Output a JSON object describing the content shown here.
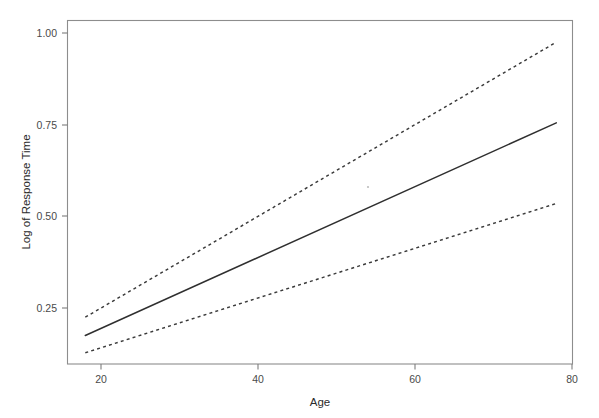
{
  "chart_data": {
    "type": "line",
    "title": "",
    "subtitle": "",
    "xlabel": "Age",
    "ylabel": "Log of Response Time",
    "xlim": [
      15.8,
      80.3
    ],
    "ylim": [
      0.105,
      1.02
    ],
    "xticks": [
      20,
      40,
      60,
      80
    ],
    "xticklabels": [
      "20",
      "40",
      "60",
      "80"
    ],
    "yticks": [
      0.25,
      0.5,
      0.75,
      1.0
    ],
    "yticklabels": [
      "0.25",
      "0.50",
      "0.75",
      "1.00"
    ],
    "grid": false,
    "legend": "none",
    "x": [
      18,
      78
    ],
    "series": [
      {
        "name": "Fitted regression line",
        "style": "solid",
        "color": "#2f2f2f",
        "values": [
          0.175,
          0.755
        ]
      },
      {
        "name": "Upper confidence band",
        "style": "dashed",
        "color": "#3a3a3a",
        "values": [
          0.225,
          0.975
        ]
      },
      {
        "name": "Lower confidence band",
        "style": "dashed",
        "color": "#3a3a3a",
        "values": [
          0.128,
          0.535
        ]
      }
    ],
    "annotations": []
  },
  "figure": {
    "background": "#ffffff",
    "frame_color": "#8d8d8d",
    "tick_color": "#7d7d7d",
    "label_color": "#2b2b2b",
    "tick_label_color": "#4a4a4a"
  },
  "axes": {
    "x_title": "Age",
    "y_title": "Log of Response Time",
    "x_tick_0": "20",
    "x_tick_1": "40",
    "x_tick_2": "60",
    "x_tick_3": "80",
    "y_tick_0": "0.25",
    "y_tick_1": "0.50",
    "y_tick_2": "0.75",
    "y_tick_3": "1.00"
  }
}
